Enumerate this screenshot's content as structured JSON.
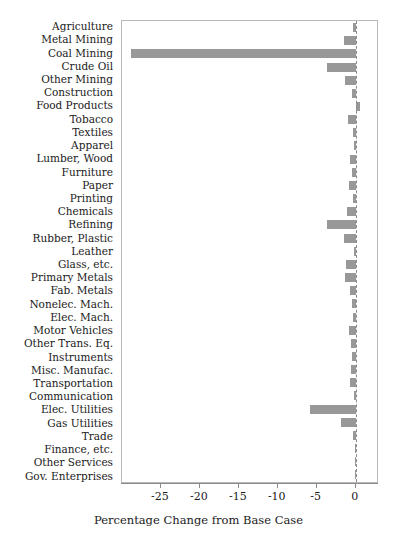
{
  "chart_data": {
    "type": "bar",
    "orientation": "horizontal",
    "title": "",
    "subtitle": "",
    "xlabel": "Percentage Change from Base Case",
    "ylabel": "",
    "xlim": [
      -30.0,
      3.0
    ],
    "xticks": [
      -25,
      -20,
      -15,
      -10,
      -5,
      0
    ],
    "xtick_labels": [
      "-25",
      "-20",
      "-15",
      "-10",
      "-5",
      "0"
    ],
    "grid": false,
    "legend": "none",
    "zero_reference_line": true,
    "bar_color": "#989898",
    "frame_color": "#b9b9b9",
    "axis_color": "#8a8a8a",
    "categories": [
      "Agriculture",
      "Metal Mining",
      "Coal Mining",
      "Crude Oil",
      "Other Mining",
      "Construction",
      "Food Products",
      "Tobacco",
      "Textiles",
      "Apparel",
      "Lumber, Wood",
      "Furniture",
      "Paper",
      "Printing",
      "Chemicals",
      "Refining",
      "Rubber, Plastic",
      "Leather",
      "Glass, etc.",
      "Primary Metals",
      "Fab. Metals",
      "Nonelec. Mach.",
      "Elec. Mach.",
      "Motor Vehicles",
      "Other Trans. Eq.",
      "Instruments",
      "Misc. Manufac.",
      "Transportation",
      "Communication",
      "Elec. Utilities",
      "Gas Utilities",
      "Trade",
      "Finance, etc.",
      "Other Services",
      "Gov. Enterprises"
    ],
    "values": [
      -0.3,
      -1.5,
      -28.8,
      -3.7,
      -1.4,
      -0.5,
      0.6,
      -1.0,
      -0.3,
      -0.2,
      -0.7,
      -0.5,
      -0.8,
      -0.3,
      -1.1,
      -3.7,
      -1.5,
      -0.2,
      -1.2,
      -1.4,
      -0.7,
      -0.5,
      -0.4,
      -0.8,
      -0.6,
      -0.5,
      -0.6,
      -0.7,
      -0.2,
      -5.8,
      -1.9,
      -0.3,
      -0.1,
      -0.1,
      -0.1
    ]
  }
}
